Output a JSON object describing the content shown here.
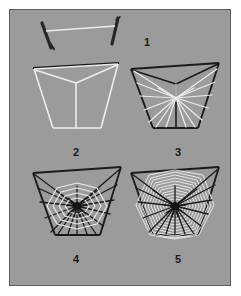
{
  "figure": {
    "caption": "Five numbered stages of orb-web building",
    "background_color": "#9b9b9b",
    "outer_color": "#ffffff",
    "border_color": "#5e5e5e",
    "thread_light_color": "#ececec",
    "thread_dark_color": "#1b1b1b",
    "label_color": "#1b1b1b"
  },
  "steps": [
    {
      "number": "1",
      "name": "bridge-thread",
      "description": "Bridge line strung between two twigs",
      "thread_color": "#ececec",
      "twig_color": "#262626"
    },
    {
      "number": "2",
      "name": "frame-and-hub",
      "description": "Outer frame trapezoid with Y-shaped first radii meeting at hub",
      "frame_color": "#ececec",
      "bridge_color": "#1b1b1b"
    },
    {
      "number": "3",
      "name": "radii",
      "description": "Radial spokes laid from hub to frame",
      "frame_color": "#1b1b1b",
      "radii_color": "#ececec",
      "radii_count": 16
    },
    {
      "number": "4",
      "name": "auxiliary-spiral",
      "description": "Auxiliary spiral spun outward from hub, spider at centre",
      "frame_color": "#1b1b1b",
      "radii_color": "#1b1b1b",
      "spiral_color": "#ececec",
      "radii_count": 16,
      "spiral_turns": 4
    },
    {
      "number": "5",
      "name": "capture-spiral",
      "description": "Completed sticky capture spiral filling the web",
      "frame_color": "#1b1b1b",
      "radii_color": "#1b1b1b",
      "spiral_color": "#ececec",
      "radii_count": 16,
      "spiral_turns": 22
    }
  ]
}
